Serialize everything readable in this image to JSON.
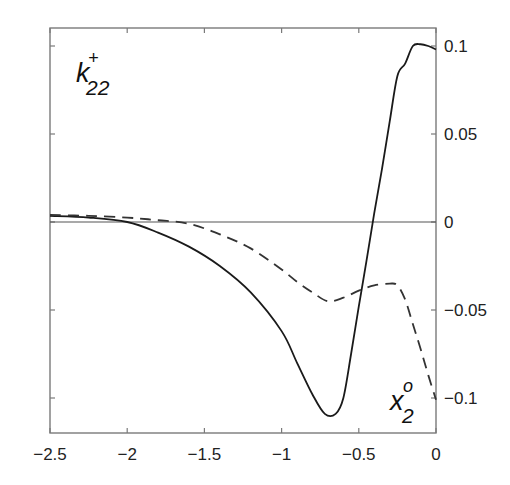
{
  "chart_data": {
    "type": "line",
    "title": "",
    "xlabel": "x_2^o",
    "ylabel": "k_22^±",
    "xlim": [
      -2.5,
      0
    ],
    "ylim": [
      -0.12,
      0.11
    ],
    "grid": false,
    "legend": null,
    "y_axis_position": "right",
    "x_ticks": [
      -2.5,
      -2,
      -1.5,
      -1,
      -0.5,
      0
    ],
    "x_tick_labels": [
      "-2.5",
      "-2",
      "-1.5",
      "-1",
      "-0.5",
      "0"
    ],
    "y_ticks": [
      0.1,
      0.05,
      0,
      -0.05,
      -0.1
    ],
    "y_tick_labels": [
      "0.1",
      "0.05",
      "0",
      "-0.05",
      "-0.1"
    ],
    "annotations": [
      {
        "text": "k",
        "sup": "+",
        "sub": "22",
        "role": "y-variable",
        "position": "top-left"
      },
      {
        "text": "x",
        "sup": "o",
        "sub": "2",
        "role": "x-variable",
        "position": "bottom-right"
      }
    ],
    "reference_lines": [
      {
        "orientation": "horizontal",
        "y": 0
      }
    ],
    "series": [
      {
        "name": "k22+ (solid)",
        "style": "solid",
        "color": "#1a1a1a",
        "x": [
          -2.5,
          -2.25,
          -2.0,
          -1.8,
          -1.6,
          -1.4,
          -1.2,
          -1.0,
          -0.9,
          -0.8,
          -0.72,
          -0.65,
          -0.6,
          -0.55,
          -0.5,
          -0.45,
          -0.4,
          -0.35,
          -0.3,
          -0.25,
          -0.2,
          -0.15,
          -0.1,
          -0.05,
          0.0
        ],
        "y": [
          0.0035,
          0.0025,
          0.0,
          -0.006,
          -0.014,
          -0.025,
          -0.04,
          -0.062,
          -0.08,
          -0.098,
          -0.109,
          -0.109,
          -0.1,
          -0.075,
          -0.048,
          -0.022,
          0.005,
          0.03,
          0.057,
          0.083,
          0.09,
          0.1,
          0.101,
          0.1,
          0.098
        ]
      },
      {
        "name": "k22- (dashed)",
        "style": "dashed",
        "color": "#333333",
        "x": [
          -2.5,
          -2.25,
          -2.0,
          -1.8,
          -1.6,
          -1.4,
          -1.2,
          -1.0,
          -0.9,
          -0.8,
          -0.7,
          -0.6,
          -0.5,
          -0.4,
          -0.3,
          -0.25,
          -0.2,
          -0.15,
          -0.1,
          -0.05,
          0.0
        ],
        "y": [
          0.004,
          0.0035,
          0.0025,
          0.001,
          -0.001,
          -0.007,
          -0.015,
          -0.027,
          -0.034,
          -0.04,
          -0.045,
          -0.043,
          -0.039,
          -0.036,
          -0.035,
          -0.036,
          -0.044,
          -0.058,
          -0.072,
          -0.087,
          -0.101
        ]
      }
    ]
  }
}
